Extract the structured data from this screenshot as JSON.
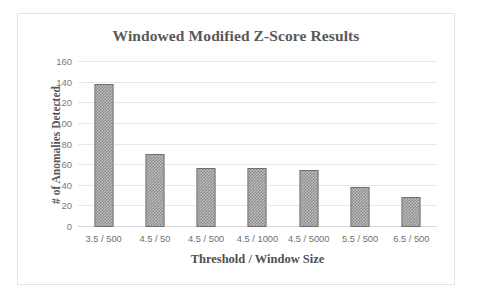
{
  "chart_data": {
    "type": "bar",
    "title": "Windowed Modified Z-Score Results",
    "xlabel": "Threshold / Window Size",
    "ylabel": "# of Anomalies Detected",
    "categories": [
      "3.5 / 500",
      "4.5 / 50",
      "4.5 / 500",
      "4.5 / 1000",
      "4.5 / 5000",
      "5.5 / 500",
      "6.5 / 500"
    ],
    "values": [
      139,
      71,
      57,
      57,
      55,
      39,
      29
    ],
    "ylim": [
      0,
      160
    ],
    "ytick_labels": [
      "160",
      "140",
      "120",
      "100",
      "80",
      "60",
      "40",
      "20",
      "0"
    ],
    "ytick_values": [
      160,
      140,
      120,
      100,
      80,
      60,
      40,
      20,
      0
    ],
    "grid": true,
    "legend": null,
    "series": [
      {
        "name": "Anomalies Detected",
        "values": [
          139,
          71,
          57,
          57,
          55,
          39,
          29
        ],
        "fill": "gray-crosshatch",
        "border_color": "#6e6e6e",
        "fill_color": "#bfbfbf"
      }
    ],
    "colors": {
      "title": "#595959",
      "axis_text": "#7a7a7a",
      "gridline": "#e8e8e8",
      "border": "#e3e3e3",
      "background": "#ffffff"
    }
  }
}
